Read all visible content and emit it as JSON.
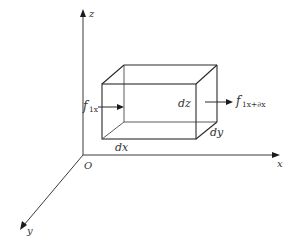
{
  "diagram": {
    "axes": {
      "z": {
        "label": "z"
      },
      "x": {
        "label": "x"
      },
      "y": {
        "label": "y"
      },
      "origin": {
        "label": "O"
      }
    },
    "element": {
      "dx_label": "dx",
      "dy_label": "dy",
      "dz_label": "dz"
    },
    "forces": {
      "left": {
        "symbol": "f",
        "subscript": "1x"
      },
      "right": {
        "symbol": "f",
        "subscript": "1x+∂x"
      }
    },
    "colors": {
      "line": "#2a2a2a",
      "text": "#333333",
      "background": "#ffffff"
    }
  }
}
